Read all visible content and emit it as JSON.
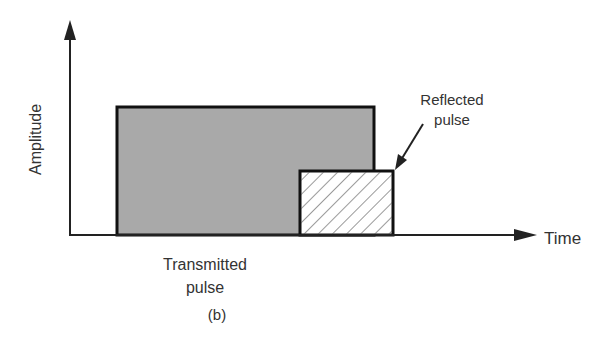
{
  "figure": {
    "caption": "(b)",
    "y_axis_label": "Amplitude",
    "x_axis_label": "Time",
    "transmitted_label_line1": "Transmitted",
    "transmitted_label_line2": "pulse",
    "reflected_label_line1": "Reflected",
    "reflected_label_line2": "pulse",
    "colors": {
      "transmitted_fill": "#a9a9a9",
      "outline": "#111111",
      "hatch": "#555555"
    }
  }
}
